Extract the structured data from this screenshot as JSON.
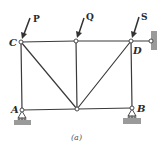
{
  "figure": {
    "caption": "(a)",
    "joints": {
      "A": {
        "label": "A"
      },
      "B": {
        "label": "B"
      },
      "C": {
        "label": "C"
      },
      "D": {
        "label": "D"
      }
    },
    "loads": {
      "P": {
        "label": "P"
      },
      "Q": {
        "label": "Q"
      },
      "S": {
        "label": "S"
      }
    },
    "colors": {
      "member": "#3a3a3a",
      "ground": "#9a9a9a",
      "text": "#2a2a2a"
    }
  }
}
